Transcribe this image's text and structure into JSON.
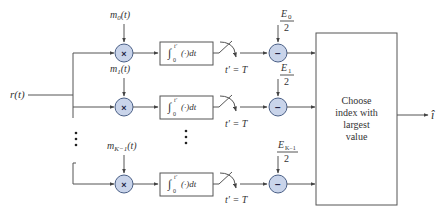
{
  "diagram": {
    "input_label": "r(t)",
    "output_label": "î",
    "decision_block": {
      "lines": [
        "Choose",
        "index with",
        "largest",
        "value"
      ]
    },
    "branches": [
      {
        "reference_signal": "m",
        "reference_subscript": "0",
        "reference_arg": "(t)",
        "multiplier_symbol": "×",
        "integrator": {
          "lower": "0",
          "upper": "t′",
          "body": "(·)dt"
        },
        "sample_label": "t′ = T",
        "bias_numerator": "E",
        "bias_subscript": "0",
        "bias_denominator": "2",
        "subtractor_symbol": "−"
      },
      {
        "reference_signal": "m",
        "reference_subscript": "1",
        "reference_arg": "(t)",
        "multiplier_symbol": "×",
        "integrator": {
          "lower": "0",
          "upper": "t′",
          "body": "(·)dt"
        },
        "sample_label": "t′ = T",
        "bias_numerator": "E",
        "bias_subscript": "1",
        "bias_denominator": "2",
        "subtractor_symbol": "−"
      },
      {
        "reference_signal": "m",
        "reference_subscript": "K−1",
        "reference_arg": "(t)",
        "multiplier_symbol": "×",
        "integrator": {
          "lower": "0",
          "upper": "t′",
          "body": "(·)dt"
        },
        "sample_label": "t′ = T",
        "bias_numerator": "E",
        "bias_subscript": "K−1",
        "bias_denominator": "2",
        "subtractor_symbol": "−"
      }
    ],
    "ellipsis": "⋮",
    "colors": {
      "line": "#555555",
      "node_fill": "#c9d4ea",
      "node_stroke": "#4a5f86",
      "text": "#333333"
    }
  }
}
